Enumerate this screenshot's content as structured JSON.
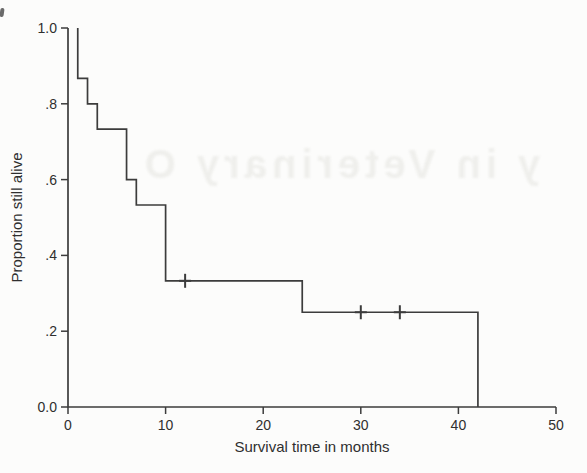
{
  "page": {
    "background": "#fcfcfb"
  },
  "watermark": {
    "text": "y in Veterinary O",
    "mirrored": true
  },
  "chart_data": {
    "type": "line",
    "subtype": "kaplan-meier-survival-step",
    "title": "",
    "xlabel": "Survival time in months",
    "ylabel": "Proportion still alive",
    "xlim": [
      0,
      50
    ],
    "ylim": [
      0.0,
      1.0
    ],
    "grid": false,
    "legend": "none",
    "line_color": "#3c3c3c",
    "text_color": "#2f2f2f",
    "x_ticks": [
      {
        "value": 0,
        "label": "0"
      },
      {
        "value": 10,
        "label": "10"
      },
      {
        "value": 20,
        "label": "20"
      },
      {
        "value": 30,
        "label": "30"
      },
      {
        "value": 40,
        "label": "40"
      },
      {
        "value": 50,
        "label": "50"
      }
    ],
    "y_ticks": [
      {
        "value": 0.0,
        "label": "0.0"
      },
      {
        "value": 0.2,
        "label": ".2"
      },
      {
        "value": 0.4,
        "label": ".4"
      },
      {
        "value": 0.6,
        "label": ".6"
      },
      {
        "value": 0.8,
        "label": ".8"
      },
      {
        "value": 1.0,
        "label": "1.0"
      }
    ],
    "series": [
      {
        "name": "Kaplan-Meier survival estimate",
        "step_points": [
          [
            1,
            1.0
          ],
          [
            1,
            0.867
          ],
          [
            2,
            0.867
          ],
          [
            2,
            0.8
          ],
          [
            3,
            0.8
          ],
          [
            3,
            0.733
          ],
          [
            6,
            0.733
          ],
          [
            6,
            0.6
          ],
          [
            7,
            0.6
          ],
          [
            7,
            0.533
          ],
          [
            10,
            0.533
          ],
          [
            10,
            0.333
          ],
          [
            24,
            0.333
          ],
          [
            24,
            0.25
          ],
          [
            42,
            0.25
          ],
          [
            42,
            0.0
          ]
        ],
        "censored_points": [
          [
            12,
            0.333
          ],
          [
            30,
            0.25
          ],
          [
            34,
            0.25
          ]
        ]
      }
    ]
  }
}
